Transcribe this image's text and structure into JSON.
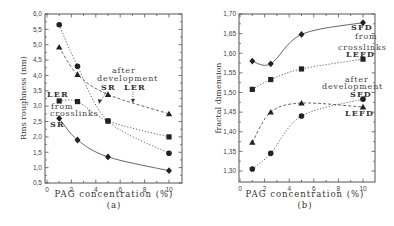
{
  "chart_data": [
    {
      "type": "line",
      "panel_label": "(a)",
      "title": "",
      "xlabel": "PAG concentration (%)",
      "ylabel": "Rms roughness (nm)",
      "xlim": [
        0,
        10.5
      ],
      "ylim": [
        0.5,
        6.0
      ],
      "xticks": [
        "0",
        "2",
        "4",
        "6",
        "8",
        "10"
      ],
      "yticks": [
        "0,5",
        "1,0",
        "1,5",
        "2,0",
        "2,5",
        "3,0",
        "3,5",
        "4,0",
        "4,5",
        "5,0",
        "5,5",
        "6,0"
      ],
      "grid": false,
      "x": [
        1,
        2.5,
        5,
        10
      ],
      "series": [
        {
          "name": "SR after development",
          "marker": "circle",
          "style": "dotted",
          "values": [
            5.65,
            4.3,
            2.52,
            1.47
          ]
        },
        {
          "name": "LER after development",
          "marker": "triangle",
          "style": "dashed",
          "values": [
            4.92,
            4.03,
            3.38,
            2.75
          ]
        },
        {
          "name": "LER from crosslinks",
          "marker": "square",
          "style": "dotted",
          "values": [
            3.17,
            3.15,
            2.52,
            2.0
          ]
        },
        {
          "name": "SR from crosslinks",
          "marker": "diamond",
          "style": "solid",
          "values": [
            2.6,
            1.9,
            1.35,
            0.9
          ]
        }
      ],
      "annotations": [
        "LER",
        "from",
        "crosslinks",
        "SR",
        "after",
        "development",
        "SR",
        "LER"
      ]
    },
    {
      "type": "line",
      "panel_label": "(b)",
      "title": "",
      "xlabel": "PAG concentration (%)",
      "ylabel": "fractal dimension",
      "xlim": [
        0,
        10.5
      ],
      "ylim": [
        1.275,
        1.7
      ],
      "xticks": [
        "0",
        "2",
        "4",
        "6",
        "8",
        "10"
      ],
      "yticks": [
        "1,30",
        "1,35",
        "1,40",
        "1,45",
        "1,50",
        "1,55",
        "1,60",
        "1,65",
        "1,70"
      ],
      "grid": false,
      "x": [
        1,
        2.5,
        5,
        10
      ],
      "series": [
        {
          "name": "SFD from crosslinks",
          "marker": "diamond",
          "style": "solid",
          "values": [
            1.58,
            1.573,
            1.648,
            1.678
          ]
        },
        {
          "name": "LEFD from crosslinks",
          "marker": "square",
          "style": "dotted",
          "values": [
            1.508,
            1.533,
            1.56,
            1.585
          ]
        },
        {
          "name": "LEFD after development",
          "marker": "triangle",
          "style": "dashed",
          "values": [
            1.373,
            1.45,
            1.473,
            1.463
          ]
        },
        {
          "name": "SFD after development",
          "marker": "circle",
          "style": "dotted",
          "values": [
            1.305,
            1.345,
            1.44,
            1.483
          ]
        }
      ],
      "annotations": [
        "SFD",
        "from",
        "crosslinks",
        "LEFD",
        "after",
        "development",
        "SFD",
        "LEFD"
      ]
    }
  ],
  "labels": {
    "a": {
      "xlabel": "PAG concentration (%)",
      "ylabel": "Rms roughness (nm)",
      "panel": "(a)",
      "ler": "LER",
      "from": "from",
      "crosslinks": "crosslinks",
      "sr": "SR",
      "after": "after",
      "development": "development",
      "sr2": "SR",
      "ler2": "LER"
    },
    "b": {
      "xlabel": "PAG concentration (%)",
      "ylabel": "fractal dimension",
      "panel": "(b)",
      "sfd": "SFD",
      "from": "from",
      "crosslinks": "crosslinks",
      "lefd": "LEFD",
      "after": "after",
      "development": "development",
      "sfd2": "SFD",
      "lefd2": "LEFD"
    }
  }
}
